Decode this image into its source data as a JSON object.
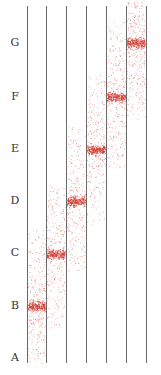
{
  "figure": {
    "type": "lane-density-diagram",
    "row_labels": [
      {
        "label": "G",
        "y": 43
      },
      {
        "label": "F",
        "y": 97
      },
      {
        "label": "E",
        "y": 149
      },
      {
        "label": "D",
        "y": 201
      },
      {
        "label": "C",
        "y": 253
      },
      {
        "label": "B",
        "y": 306
      },
      {
        "label": "A",
        "y": 358
      }
    ],
    "line_x": [
      27,
      46,
      66,
      86,
      106,
      126,
      146
    ],
    "lanes": [
      {
        "index": 1,
        "band_label": "B",
        "center_y": 306,
        "spread_top": 228,
        "spread_bottom": 363
      },
      {
        "index": 2,
        "band_label": "C",
        "center_y": 254,
        "spread_top": 185,
        "spread_bottom": 328
      },
      {
        "index": 3,
        "band_label": "D",
        "center_y": 201,
        "spread_top": 125,
        "spread_bottom": 272
      },
      {
        "index": 4,
        "band_label": "E",
        "center_y": 150,
        "spread_top": 75,
        "spread_bottom": 225
      },
      {
        "index": 5,
        "band_label": "F",
        "center_y": 97,
        "spread_top": 20,
        "spread_bottom": 168
      },
      {
        "index": 6,
        "band_label": "G",
        "center_y": 43,
        "spread_top": 0,
        "spread_bottom": 120
      }
    ],
    "colors": {
      "dot": "#d23a30",
      "line": "#6a6a6a",
      "label": "#333333"
    }
  }
}
